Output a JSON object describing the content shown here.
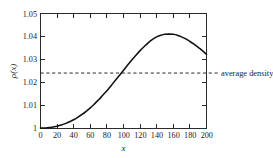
{
  "chart_data": {
    "type": "line",
    "title": "",
    "xlabel": "x",
    "ylabel": "ρ(x)",
    "xlim": [
      0,
      200
    ],
    "ylim": [
      1.0,
      1.05
    ],
    "grid": false,
    "legend_position": "none",
    "xticks": [
      0,
      20,
      40,
      60,
      80,
      100,
      120,
      140,
      160,
      180,
      200
    ],
    "xtick_labels": [
      "0",
      "20",
      "40",
      "60",
      "80",
      "100",
      "120",
      "140",
      "160",
      "180",
      "200"
    ],
    "yticks": [
      1.0,
      1.01,
      1.02,
      1.03,
      1.04,
      1.05
    ],
    "ytick_labels": [
      "1",
      "1.01",
      "1.02",
      "1.03",
      "1.04",
      "1.05"
    ],
    "series": [
      {
        "name": "ρ(x)",
        "style": "solid",
        "color": "#111111",
        "x": [
          0,
          5,
          10,
          15,
          20,
          25,
          30,
          35,
          40,
          45,
          50,
          55,
          60,
          65,
          70,
          75,
          80,
          85,
          90,
          95,
          100,
          105,
          110,
          115,
          120,
          125,
          130,
          135,
          140,
          145,
          150,
          155,
          160,
          165,
          170,
          175,
          180,
          185,
          190,
          195,
          200
        ],
        "y": [
          1.0,
          1.0,
          1.0002,
          1.0004,
          1.0008,
          1.0013,
          1.0019,
          1.0027,
          1.0036,
          1.0047,
          1.0059,
          1.0073,
          1.0088,
          1.0105,
          1.0123,
          1.0143,
          1.0163,
          1.0185,
          1.0207,
          1.0229,
          1.0252,
          1.0275,
          1.0297,
          1.0318,
          1.0338,
          1.0356,
          1.0373,
          1.0387,
          1.0398,
          1.0405,
          1.0409,
          1.041,
          1.0409,
          1.0405,
          1.0398,
          1.0389,
          1.0378,
          1.0366,
          1.0352,
          1.0338,
          1.0322
        ]
      }
    ],
    "annotations": [
      {
        "type": "hline",
        "label": "average density",
        "value": 1.024,
        "style": "dashed",
        "color": "#2b2b2b"
      }
    ],
    "notes": {
      "peak_x": 155,
      "peak_y": 1.041,
      "start_y": 1.0,
      "end_y": 1.0322,
      "avg_crossing_x": 97
    }
  },
  "axes": {
    "y_title": "ρ(x)",
    "x_title": "x"
  },
  "annotation": {
    "average_density_label": "average density"
  },
  "colors": {
    "curve": "#111111",
    "frame": "#2b2b2b",
    "dashed": "#2b2b2b",
    "background": "#ffffff",
    "text": "#1a1a1a"
  }
}
